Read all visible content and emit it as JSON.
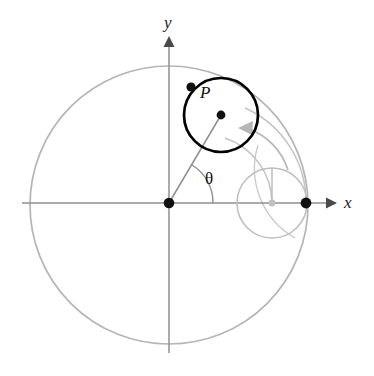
{
  "figure": {
    "background_color": "#ffffff",
    "width": 374,
    "height": 376,
    "colors": {
      "axis": "#8c8c8c",
      "light_gray": "#b3b3b3",
      "mid_gray": "#9a9a9a",
      "bold_black": "#000000",
      "dot_black": "#111111",
      "text": "#1a1a1a"
    }
  },
  "axes": {
    "origin": {
      "x": 169,
      "y": 203
    },
    "x_axis": {
      "label": "x",
      "label_pos": {
        "x": 345,
        "y": 195
      },
      "start": {
        "x": 22,
        "y": 203
      },
      "end": {
        "x": 327,
        "y": 203
      },
      "arrow_tip": {
        "x": 334,
        "y": 203
      }
    },
    "y_axis": {
      "label": "y",
      "label_pos": {
        "x": 164,
        "y": 15
      },
      "start": {
        "x": 169,
        "y": 352
      },
      "end": {
        "x": 169,
        "y": 45
      },
      "arrow_tip": {
        "x": 169,
        "y": 38
      }
    }
  },
  "large_circle": {
    "name": "fixed-base-circle",
    "center": {
      "x": 169,
      "y": 205
    },
    "radius": 139,
    "stroke": "#b3b3b3",
    "stroke_width": 1.6
  },
  "small_circle_start": {
    "name": "rolling-circle-start-position",
    "center": {
      "x": 272,
      "y": 203
    },
    "radius": 35,
    "stroke": "#bdbdbd",
    "stroke_width": 1.6,
    "center_dot": {
      "x": 272,
      "y": 203,
      "r": 3.2,
      "fill": "#bdbdbd"
    },
    "radius_line_to": {
      "x": 272,
      "y": 168
    }
  },
  "small_circle_rolled": {
    "name": "rolling-circle-current-position",
    "center": {
      "x": 221,
      "y": 115
    },
    "radius": 37,
    "stroke": "#000000",
    "stroke_width": 2.6,
    "center_dot": {
      "x": 221,
      "y": 115,
      "r": 4.2,
      "fill": "#111111"
    }
  },
  "tracing_point": {
    "label": "P",
    "label_pos": {
      "x": 200,
      "y": 86
    },
    "dot": {
      "x": 191,
      "y": 87,
      "r": 4.4,
      "fill": "#111111"
    }
  },
  "start_point": {
    "name": "start-point-on-x-axis",
    "dot": {
      "x": 306,
      "y": 203,
      "r": 5.2,
      "fill": "#111111"
    }
  },
  "origin_point": {
    "name": "origin-dot",
    "dot": {
      "x": 169,
      "y": 203,
      "r": 5.2,
      "fill": "#111111"
    }
  },
  "angle": {
    "label": "θ",
    "label_pos": {
      "x": 206,
      "y": 172
    },
    "vertex": {
      "x": 169,
      "y": 203
    },
    "arc_radius": 44,
    "start_deg": 0,
    "end_deg": 60,
    "stroke": "#8c8c8c"
  },
  "radial_line": {
    "name": "radius-to-rolling-center",
    "from": {
      "x": 169,
      "y": 203
    },
    "to": {
      "x": 221,
      "y": 115
    },
    "stroke": "#8c8c8c",
    "stroke_width": 1.4
  },
  "motion_arc": {
    "name": "rolling-motion-arrow",
    "description": "gray arc with arrowhead showing the rolling direction of the small circle",
    "arrow_tip": {
      "x": 241,
      "y": 127
    },
    "stroke": "#b3b3b3",
    "stroke_width": 1.6
  },
  "construction_arcs": [
    {
      "name": "outer-construction-arc",
      "stroke": "#c2c2c2"
    },
    {
      "name": "inner-construction-arc",
      "stroke": "#c2c2c2"
    }
  ]
}
